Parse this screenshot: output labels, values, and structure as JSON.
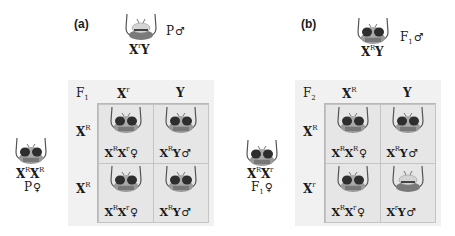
{
  "panels": [
    {
      "label": "(a)",
      "male_parent": {
        "genotype_base": "X",
        "allele": "r",
        "rest": "Y",
        "tag": "P",
        "tag_sub": "",
        "sex": "♂",
        "eye": "white"
      },
      "female_parent": {
        "g1": "X",
        "a1": "R",
        "g2": "X",
        "a2": "R",
        "tag": "P",
        "tag_sub": "",
        "sex": "♀",
        "eye": "red"
      },
      "generation": {
        "base": "F",
        "sub": "1"
      },
      "columns": [
        {
          "base": "X",
          "allele": "r"
        },
        {
          "base": "Y",
          "allele": ""
        }
      ],
      "rows": [
        {
          "base": "X",
          "allele": "R"
        },
        {
          "base": "X",
          "allele": "R"
        }
      ],
      "cells": [
        {
          "g1": "X",
          "a1": "R",
          "g2": "X",
          "a2": "r",
          "sex": "♀",
          "eye": "red"
        },
        {
          "g1": "X",
          "a1": "R",
          "g2": "Y",
          "a2": "",
          "sex": "♂",
          "eye": "red"
        },
        {
          "g1": "X",
          "a1": "R",
          "g2": "X",
          "a2": "r",
          "sex": "♀",
          "eye": "red"
        },
        {
          "g1": "X",
          "a1": "R",
          "g2": "Y",
          "a2": "",
          "sex": "♂",
          "eye": "red"
        }
      ]
    },
    {
      "label": "(b)",
      "male_parent": {
        "genotype_base": "X",
        "allele": "R",
        "rest": "Y",
        "tag": "F",
        "tag_sub": "1",
        "sex": "♂",
        "eye": "red"
      },
      "female_parent": {
        "g1": "X",
        "a1": "R",
        "g2": "X",
        "a2": "r",
        "tag": "F",
        "tag_sub": "1",
        "sex": "♀",
        "eye": "red"
      },
      "generation": {
        "base": "F",
        "sub": "2"
      },
      "columns": [
        {
          "base": "X",
          "allele": "R"
        },
        {
          "base": "Y",
          "allele": ""
        }
      ],
      "rows": [
        {
          "base": "X",
          "allele": "R"
        },
        {
          "base": "X",
          "allele": "r"
        }
      ],
      "cells": [
        {
          "g1": "X",
          "a1": "R",
          "g2": "X",
          "a2": "R",
          "sex": "♀",
          "eye": "red"
        },
        {
          "g1": "X",
          "a1": "R",
          "g2": "Y",
          "a2": "",
          "sex": "♂",
          "eye": "red"
        },
        {
          "g1": "X",
          "a1": "R",
          "g2": "X",
          "a2": "r",
          "sex": "♀",
          "eye": "red"
        },
        {
          "g1": "X",
          "a1": "r",
          "g2": "Y",
          "a2": "",
          "sex": "♂",
          "eye": "white"
        }
      ]
    }
  ]
}
